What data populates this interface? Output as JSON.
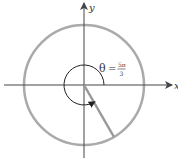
{
  "diagram": {
    "axes": {
      "x_label": "x",
      "y_label": "y"
    },
    "angle": {
      "symbol": "θ",
      "equals": "=",
      "numerator": "5π",
      "denominator": "3",
      "value_radians": "5π/3",
      "direction": "counterclockwise"
    },
    "circle": {
      "type": "unit circle",
      "color": "#aaaaaa"
    },
    "colors": {
      "axis": "#444444",
      "circle": "#aaaaaa",
      "terminal_side": "#999999",
      "arc": "#222222"
    }
  }
}
